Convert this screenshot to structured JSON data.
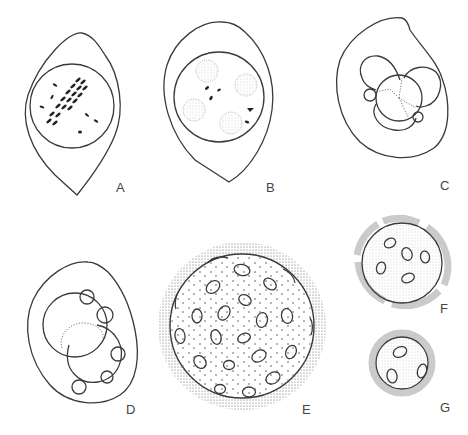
{
  "figure": {
    "panels": [
      {
        "id": "A",
        "label": "A",
        "description": "Lemon-shaped cell with round nucleus containing metaphase chromosomes aligned diagonally plus scattered small chromosomes"
      },
      {
        "id": "B",
        "label": "B",
        "description": "Lemon-shaped cell with round nucleus containing four stippled spherical bodies and a few small dark granules"
      },
      {
        "id": "C",
        "label": "C",
        "description": "Ovoid cell with cluster of four overlapping lobes around a central sphere with dotted three-way partition, small bud at left and lower right"
      },
      {
        "id": "D",
        "label": "D",
        "description": "Rounded teardrop cell with two overlapping large spheres and five small peripheral buds"
      },
      {
        "id": "E",
        "label": "E",
        "description": "Large spherical body with thick stippled outer wall, dotted interior and many oval inclusions"
      },
      {
        "id": "F",
        "label": "F",
        "description": "Medium sphere with gray stippled broken wall and five oval inclusions"
      },
      {
        "id": "G",
        "label": "G",
        "description": "Small sphere with gray stippled wall and three oval inclusions"
      }
    ]
  },
  "colors": {
    "line": "#3a3a3a",
    "stipple": "#8a8a8a",
    "background": "#ffffff"
  }
}
